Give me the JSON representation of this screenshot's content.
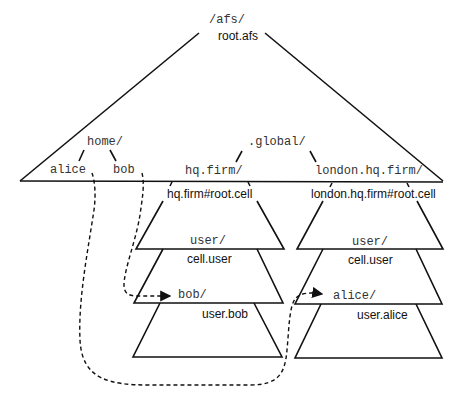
{
  "root": {
    "mount": "/afs/",
    "volume": "root.afs"
  },
  "root_entries": {
    "home": "home/",
    "alice": "alice",
    "bob": "bob",
    "global": ".global/",
    "hq_mount": "hq.firm/",
    "london_mount": "london.hq.firm/"
  },
  "cells": [
    {
      "root_volume": "hq.firm#root.cell",
      "user_mount": "user/",
      "user_volume": "cell.user",
      "home_mount": "bob/",
      "home_volume": "user.bob"
    },
    {
      "root_volume": "london.hq.firm#root.cell",
      "user_mount": "user/",
      "user_volume": "cell.user",
      "home_mount": "alice/",
      "home_volume": "user.alice"
    }
  ],
  "colors": {
    "line": "#111111",
    "mono_text": "#333333",
    "background": "#ffffff"
  }
}
